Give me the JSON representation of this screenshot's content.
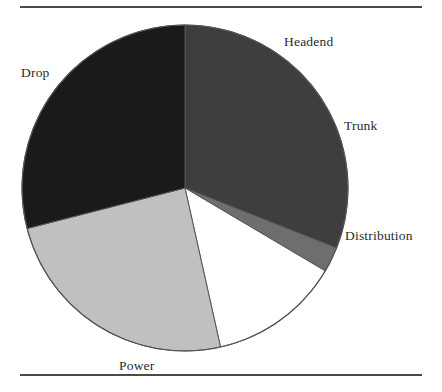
{
  "figure": {
    "background_color": "#ffffff",
    "rule_color": "#4a4a4a"
  },
  "chart_data": {
    "type": "pie",
    "title": "",
    "subtitle": "",
    "xlabel": "",
    "ylabel": "",
    "legend_position": "none",
    "grid": false,
    "labels_outside": true,
    "start_angle_deg": 0,
    "direction": "clockwise",
    "center": {
      "x": 185,
      "y": 188
    },
    "radius": 163,
    "outline_color": "#555555",
    "categories": [
      "Headend",
      "Trunk",
      "Distribution",
      "Power",
      "Drop"
    ],
    "values": [
      31.0,
      2.5,
      13.0,
      24.5,
      29.0
    ],
    "units": "percent",
    "slices": [
      {
        "label": "Headend",
        "value": 31.0,
        "angle_deg": 111.6,
        "start_deg": 0.0,
        "end_deg": 111.6,
        "color": "#3e3e3e",
        "label_x": 284,
        "label_y": 34
      },
      {
        "label": "Trunk",
        "value": 2.5,
        "angle_deg": 9.0,
        "start_deg": 111.6,
        "end_deg": 120.6,
        "color": "#6e6e6e",
        "label_x": 344,
        "label_y": 118
      },
      {
        "label": "Distribution",
        "value": 13.0,
        "angle_deg": 46.8,
        "start_deg": 120.6,
        "end_deg": 167.4,
        "color": "#ffffff",
        "label_x": 345,
        "label_y": 228
      },
      {
        "label": "Power",
        "value": 24.5,
        "angle_deg": 88.2,
        "start_deg": 167.4,
        "end_deg": 255.6,
        "color": "#c0c0c0",
        "label_x": 119,
        "label_y": 358
      },
      {
        "label": "Drop",
        "value": 29.0,
        "angle_deg": 104.4,
        "start_deg": 255.6,
        "end_deg": 360.0,
        "color": "#1a1a1a",
        "label_x": 21,
        "label_y": 65
      }
    ]
  }
}
